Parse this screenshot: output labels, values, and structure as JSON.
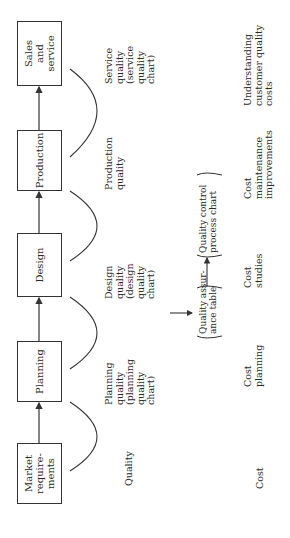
{
  "process_steps": [
    {
      "label": "Market\nrequire-\nments"
    },
    {
      "label": "Planning"
    },
    {
      "label": "Design"
    },
    {
      "label": "Production"
    },
    {
      "label": "Sales\nand\nservice"
    }
  ],
  "quality_row": {
    "row_label": "Quality",
    "items": [
      "Planning\nquality\n(planning\nquality\nchart)",
      "Design\nquality\n(design\nquality\nchart)",
      "Production\nquality",
      "Service\nquality\n(service\nquality\nchart)"
    ],
    "assurance_table": "Quality assur-\nance table",
    "control_chart": "Quality control\nprocess chart"
  },
  "cost_row": {
    "row_label": "Cost",
    "items": [
      "Cost\nplanning",
      "Cost\nstudies",
      "Cost\nmaintenance\nimprovements",
      "Understanding\ncustomer quality\ncosts"
    ]
  },
  "colors": {
    "line": "#333333",
    "text": "#2a2a2a",
    "background": "#ffffff"
  }
}
